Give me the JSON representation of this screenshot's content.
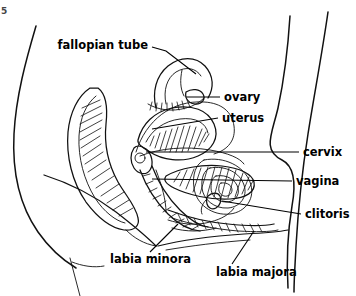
{
  "figure": {
    "background_color": "#ffffff",
    "line_color": "#111111",
    "label_color": "#000000",
    "corner_mark": "5"
  },
  "labels": [
    {
      "id": "fallopian-tube",
      "text": "fallopian tube",
      "anchor": "end",
      "x": 148,
      "y": 45,
      "leader": "M 152 47 L 166 51 L 196 74"
    },
    {
      "id": "ovary",
      "text": "ovary",
      "anchor": "start",
      "x": 224,
      "y": 97,
      "leader": "M 220 97 L 186 97"
    },
    {
      "id": "uterus",
      "text": "uterus",
      "anchor": "start",
      "x": 222,
      "y": 118,
      "leader": "M 218 118 L 152 129"
    },
    {
      "id": "cervix",
      "text": "cervix",
      "anchor": "start",
      "x": 303,
      "y": 152,
      "leader": "M 299 152 L 146 152"
    },
    {
      "id": "vagina",
      "text": "vagina",
      "anchor": "start",
      "x": 296,
      "y": 181,
      "leader": "M 292 181 L 152 179"
    },
    {
      "id": "clitoris",
      "text": "clitoris",
      "anchor": "start",
      "x": 305,
      "y": 214,
      "leader": "M 301 214 L 222 201"
    },
    {
      "id": "labia-minora",
      "text": "labia minora",
      "anchor": "start",
      "x": 110,
      "y": 259,
      "leader": "M 150 252 L 178 224"
    },
    {
      "id": "labia-majora",
      "text": "labia majora",
      "anchor": "start",
      "x": 216,
      "y": 272,
      "leader": "M 232 264 L 254 231"
    }
  ],
  "structures": [
    "abdominal wall",
    "bladder",
    "uterus",
    "fallopian tube",
    "ovary",
    "cervix",
    "vagina",
    "rectum",
    "clitoris",
    "labia minora",
    "labia majora",
    "back contour",
    "buttock contour"
  ]
}
